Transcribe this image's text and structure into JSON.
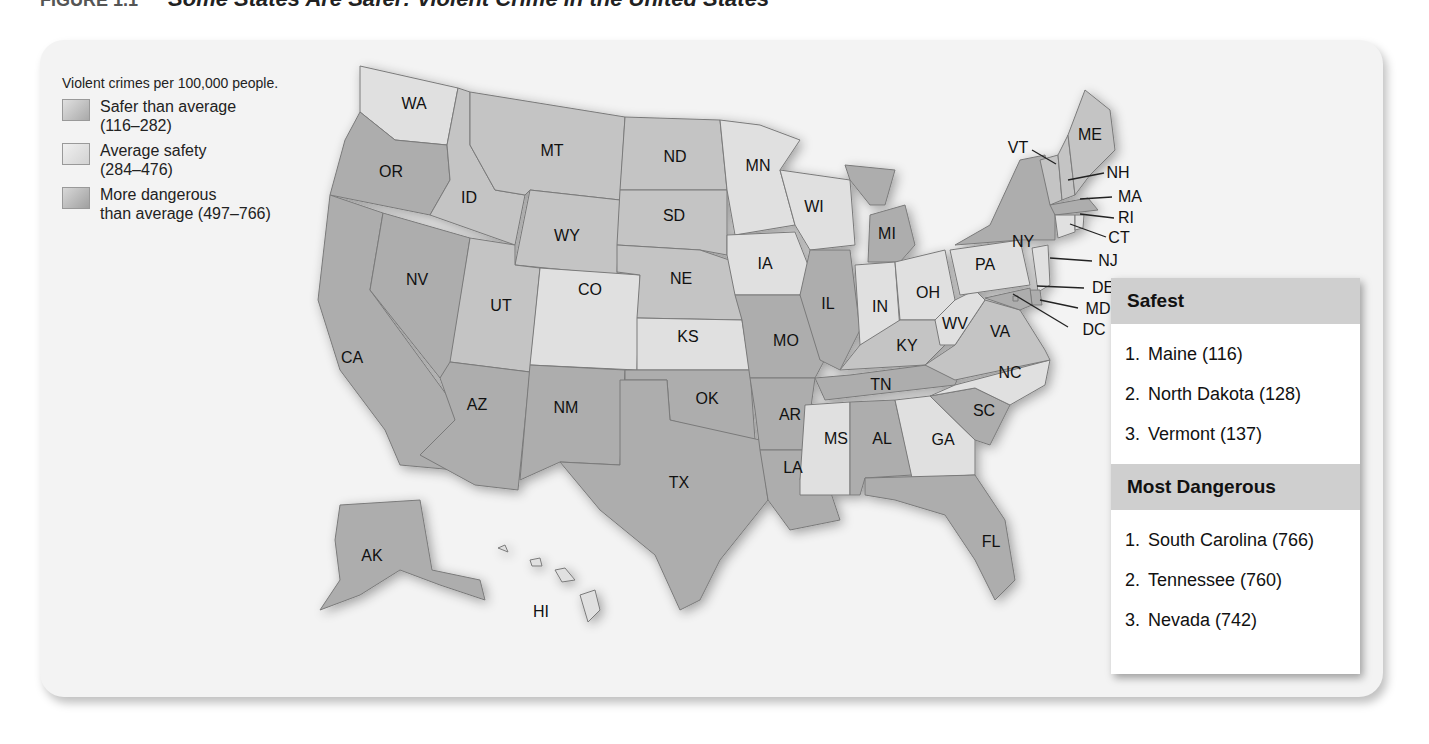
{
  "figure": {
    "number": "FIGURE 1.1",
    "title": "Some States Are Safer: Violent Crime in the United States"
  },
  "legend": {
    "heading": "Violent crimes per 100,000 people.",
    "items": [
      {
        "label": "Safer than average",
        "range": "(116–282)",
        "color": "#c9c9c9"
      },
      {
        "label": "Average safety",
        "range": "(284–476)",
        "color": "#e2e2e2"
      },
      {
        "label": "More dangerous",
        "range": "than average (497–766)",
        "color": "#b3b3b3"
      }
    ]
  },
  "colors": {
    "safer": "#c4c4c4",
    "average": "#e0e0e0",
    "dangerous": "#adadad",
    "border": "#7a7a7a",
    "card": "#f3f3f3",
    "header": "#cfcfcf"
  },
  "states": [
    {
      "abbr": "WA",
      "category": "average"
    },
    {
      "abbr": "OR",
      "category": "dangerous"
    },
    {
      "abbr": "CA",
      "category": "dangerous"
    },
    {
      "abbr": "ID",
      "category": "safer"
    },
    {
      "abbr": "NV",
      "category": "dangerous"
    },
    {
      "abbr": "MT",
      "category": "safer"
    },
    {
      "abbr": "WY",
      "category": "safer"
    },
    {
      "abbr": "UT",
      "category": "safer"
    },
    {
      "abbr": "AZ",
      "category": "dangerous"
    },
    {
      "abbr": "CO",
      "category": "average"
    },
    {
      "abbr": "NM",
      "category": "dangerous"
    },
    {
      "abbr": "ND",
      "category": "safer"
    },
    {
      "abbr": "SD",
      "category": "safer"
    },
    {
      "abbr": "NE",
      "category": "safer"
    },
    {
      "abbr": "KS",
      "category": "average"
    },
    {
      "abbr": "OK",
      "category": "dangerous"
    },
    {
      "abbr": "TX",
      "category": "dangerous"
    },
    {
      "abbr": "MN",
      "category": "average"
    },
    {
      "abbr": "IA",
      "category": "average"
    },
    {
      "abbr": "MO",
      "category": "dangerous"
    },
    {
      "abbr": "AR",
      "category": "dangerous"
    },
    {
      "abbr": "LA",
      "category": "dangerous"
    },
    {
      "abbr": "WI",
      "category": "average"
    },
    {
      "abbr": "IL",
      "category": "dangerous"
    },
    {
      "abbr": "MI",
      "category": "dangerous"
    },
    {
      "abbr": "IN",
      "category": "average"
    },
    {
      "abbr": "OH",
      "category": "average"
    },
    {
      "abbr": "KY",
      "category": "safer"
    },
    {
      "abbr": "TN",
      "category": "dangerous"
    },
    {
      "abbr": "MS",
      "category": "average"
    },
    {
      "abbr": "AL",
      "category": "dangerous"
    },
    {
      "abbr": "GA",
      "category": "average"
    },
    {
      "abbr": "FL",
      "category": "dangerous"
    },
    {
      "abbr": "SC",
      "category": "dangerous"
    },
    {
      "abbr": "NC",
      "category": "average"
    },
    {
      "abbr": "VA",
      "category": "safer"
    },
    {
      "abbr": "WV",
      "category": "average"
    },
    {
      "abbr": "PA",
      "category": "average"
    },
    {
      "abbr": "NY",
      "category": "dangerous"
    },
    {
      "abbr": "VT",
      "category": "safer"
    },
    {
      "abbr": "NH",
      "category": "safer"
    },
    {
      "abbr": "ME",
      "category": "safer"
    },
    {
      "abbr": "MA",
      "category": "dangerous"
    },
    {
      "abbr": "RI",
      "category": "average"
    },
    {
      "abbr": "CT",
      "category": "average"
    },
    {
      "abbr": "NJ",
      "category": "average"
    },
    {
      "abbr": "DE",
      "category": "dangerous"
    },
    {
      "abbr": "MD",
      "category": "dangerous"
    },
    {
      "abbr": "DC",
      "category": "dangerous"
    },
    {
      "abbr": "AK",
      "category": "dangerous"
    },
    {
      "abbr": "HI",
      "category": "average"
    }
  ],
  "rankings": {
    "safest": {
      "title": "Safest",
      "items": [
        {
          "rank": "1.",
          "text": "Maine (116)"
        },
        {
          "rank": "2.",
          "text": "North Dakota (128)"
        },
        {
          "rank": "3.",
          "text": "Vermont (137)"
        }
      ]
    },
    "dangerous": {
      "title": "Most Dangerous",
      "items": [
        {
          "rank": "1.",
          "text": "South Carolina (766)"
        },
        {
          "rank": "2.",
          "text": "Tennessee (760)"
        },
        {
          "rank": "3.",
          "text": "Nevada (742)"
        }
      ]
    }
  }
}
